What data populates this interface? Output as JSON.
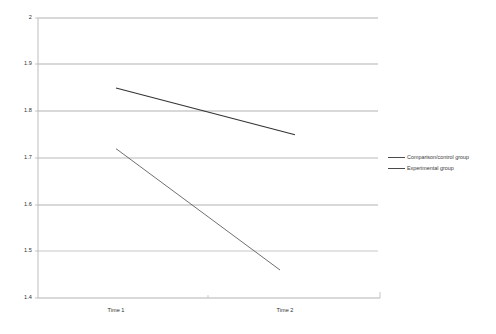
{
  "chart_data": {
    "type": "line",
    "title": "",
    "subtitle": "",
    "xlabel": "",
    "ylabel": "",
    "categories": [
      "Time 1",
      "Time 2"
    ],
    "x_tick_labels": [
      "Time 1",
      "Time 2"
    ],
    "y_tick_labels": [
      "2",
      "1.9",
      "1.8",
      "1.7",
      "1.6",
      "1.5",
      "1.4"
    ],
    "y_ticks": [
      2,
      1.9,
      1.8,
      1.7,
      1.6,
      1.5,
      1.4
    ],
    "ylim": [
      1.4,
      2
    ],
    "grid": true,
    "grid_axis": "y",
    "legend_position": "right",
    "series": [
      {
        "name": "Comparison/control group",
        "values": [
          1.85,
          1.75
        ],
        "color": "#333333"
      },
      {
        "name": "Experimental group",
        "values": [
          1.72,
          1.46
        ],
        "color": "#555555"
      }
    ]
  },
  "legend": {
    "entries": [
      {
        "label": "Comparison/control group"
      },
      {
        "label": "Experimental group"
      }
    ]
  },
  "axes": {
    "y_labels": [
      "2",
      "1.9",
      "1.8",
      "1.7",
      "1.6",
      "1.5",
      "1.4"
    ],
    "x_labels": [
      "Time 1",
      "Time 2"
    ]
  },
  "colors": {
    "series_control": "#333333",
    "series_experimental": "#555555",
    "grid": "#9a9a9a",
    "axis": "#b5b5b5",
    "text": "#2f2f2f",
    "background": "#ffffff"
  }
}
